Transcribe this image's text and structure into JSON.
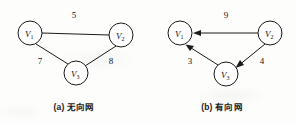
{
  "figure": {
    "background_color": "#fdfdfb",
    "stroke_color": "#1a1a1a",
    "panels": [
      {
        "id": "panel-a",
        "caption": "(a) 无向网",
        "graph_type": "undirected",
        "nodes": [
          {
            "id": "V1",
            "label": "V",
            "subscript": "1",
            "cx": 30,
            "cy": 33,
            "r": 12
          },
          {
            "id": "V2",
            "label": "V",
            "subscript": "2",
            "cx": 121,
            "cy": 35,
            "r": 12
          },
          {
            "id": "V3",
            "label": "V",
            "subscript": "3",
            "cx": 76,
            "cy": 73,
            "r": 12
          }
        ],
        "edges": [
          {
            "from": "V1",
            "to": "V2",
            "weight": "5",
            "label_x": 74,
            "label_y": 18
          },
          {
            "from": "V1",
            "to": "V3",
            "weight": "7",
            "label_x": 40,
            "label_y": 64
          },
          {
            "from": "V2",
            "to": "V3",
            "weight": "8",
            "label_x": 111,
            "label_y": 64
          }
        ]
      },
      {
        "id": "panel-b",
        "caption": "(b) 有向网",
        "graph_type": "directed",
        "nodes": [
          {
            "id": "V1",
            "label": "V",
            "subscript": "1",
            "cx": 32,
            "cy": 33,
            "r": 12
          },
          {
            "id": "V2",
            "label": "V",
            "subscript": "2",
            "cx": 122,
            "cy": 33,
            "r": 12
          },
          {
            "id": "V3",
            "label": "V",
            "subscript": "3",
            "cx": 78,
            "cy": 74,
            "r": 12
          }
        ],
        "edges": [
          {
            "from": "V2",
            "to": "V1",
            "weight": "9",
            "label_x": 78,
            "label_y": 18,
            "directed": true
          },
          {
            "from": "V3",
            "to": "V1",
            "weight": "3",
            "label_x": 42,
            "label_y": 64,
            "directed": true
          },
          {
            "from": "V2",
            "to": "V3",
            "weight": "4",
            "label_x": 114,
            "label_y": 64,
            "directed": true
          }
        ]
      }
    ]
  }
}
